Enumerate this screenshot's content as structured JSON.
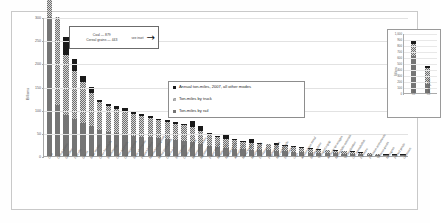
{
  "chart_data": {
    "type": "bar",
    "title": "",
    "xlabel": "",
    "ylabel": "Billions",
    "ylim": [
      0,
      300
    ],
    "yticks": [
      0,
      50,
      100,
      150,
      200,
      250,
      300
    ],
    "ytick_labels": [
      "0",
      "50",
      "100",
      "150",
      "200",
      "250",
      "300"
    ],
    "grid": true,
    "stacked": true,
    "legend_position": "inside-center",
    "note": "Two leading bars exceed the axis maximum and are truncated; their true values are shown in the callout and in the inset panel.",
    "series": [
      {
        "name": "Ton-miles by rail",
        "key": "rail",
        "color": "#757575",
        "values": [
          300,
          110,
          88,
          80,
          72,
          64,
          56,
          52,
          50,
          46,
          44,
          42,
          40,
          38,
          36,
          34,
          32,
          30,
          26,
          22,
          19,
          17,
          16,
          15,
          14,
          13,
          12,
          11,
          10,
          9,
          8,
          7.5,
          7,
          6,
          5.5,
          5,
          4,
          3.5,
          3,
          2,
          1.5,
          1,
          0.5
        ]
      },
      {
        "name": "Ton-miles by truck",
        "key": "truck",
        "color": "#6e6e6e",
        "pattern": "checker",
        "values": [
          300,
          190,
          130,
          104,
          88,
          72,
          60,
          56,
          52,
          48,
          46,
          44,
          42,
          40,
          38,
          36,
          34,
          32,
          28,
          24,
          21,
          19,
          18,
          16,
          15,
          14,
          13,
          12,
          11,
          10,
          9,
          8,
          7,
          6,
          5.5,
          5,
          4.5,
          4,
          3,
          2,
          1.5,
          1,
          0.5
        ]
      },
      {
        "name": "Annual ton-miles, 2007, all other modes",
        "key": "other",
        "color": "#1a1a1a",
        "values": [
          0,
          0,
          38,
          26,
          12,
          14,
          6,
          5,
          5,
          10,
          4,
          4,
          4,
          3,
          3,
          3,
          3,
          14,
          10,
          3,
          3,
          9,
          3,
          2,
          8,
          2,
          2,
          6,
          2,
          2,
          2,
          2,
          2,
          1.5,
          1.5,
          1,
          1,
          1,
          1,
          0.5,
          0.5,
          0.3,
          0.2
        ]
      }
    ],
    "categories": [
      "Coal",
      "Cereal grains",
      "Gasoline",
      "Fuel oils",
      "Gravel",
      "Base metals",
      "Other foodstuffs",
      "Waste/scrap",
      "Other ag prods",
      "Chemical prods",
      "Basic chemicals",
      "Plastics/rubber",
      "Nonmetal min prods",
      "Milled grain prods",
      "Coal-n.e.c.",
      "Wood prods",
      "Crude petroleum",
      "Motorized vehicles",
      "Machinery",
      "Paper articles",
      "Metallic ores",
      "Natural sands",
      "Animal feed",
      "Mixed freight",
      "Meat/seafood",
      "Fertilizers",
      "Pulp/newsprint",
      "Misc mfg prods",
      "Electronics",
      "Logs",
      "Articles-base metal",
      "Building stone",
      "Transport equip",
      "Alcoholic beverages",
      "Nonmetallic minerals",
      "Textiles/leather",
      "Live animals/fish",
      "Furniture",
      "Precision instruments",
      "Tobacco prods",
      "Newsprint",
      "Printed prods",
      "Unknown"
    ]
  },
  "callout": {
    "line1": "Coal — 879",
    "line2": "Cereal grains — 443",
    "see_inset": "see inset",
    "arrow_icon": "→"
  },
  "legend": {
    "items": [
      {
        "label": "Annual ton-miles, 2007, all other modes",
        "swatch": "sw-other"
      },
      {
        "label": "Ton-miles by truck",
        "swatch": "sw-truck"
      },
      {
        "label": "Ton-miles by rail",
        "swatch": "sw-rail"
      }
    ]
  },
  "inset": {
    "ylabel": "Billions",
    "ylim": [
      0,
      1000
    ],
    "ytick_labels": [
      "1,000",
      "900",
      "800",
      "700",
      "600",
      "500",
      "400",
      "300",
      "200",
      "100",
      "0"
    ],
    "categories": [
      "Coal",
      "Cereal grains"
    ],
    "series": [
      {
        "name": "Ton-miles by rail",
        "key": "rail",
        "values": [
          620,
          150
        ]
      },
      {
        "name": "Ton-miles by truck",
        "key": "truck",
        "values": [
          200,
          260
        ]
      },
      {
        "name": "Annual ton-miles, 2007, all other modes",
        "key": "other",
        "values": [
          59,
          33
        ]
      }
    ],
    "totals": [
      879,
      443
    ]
  }
}
